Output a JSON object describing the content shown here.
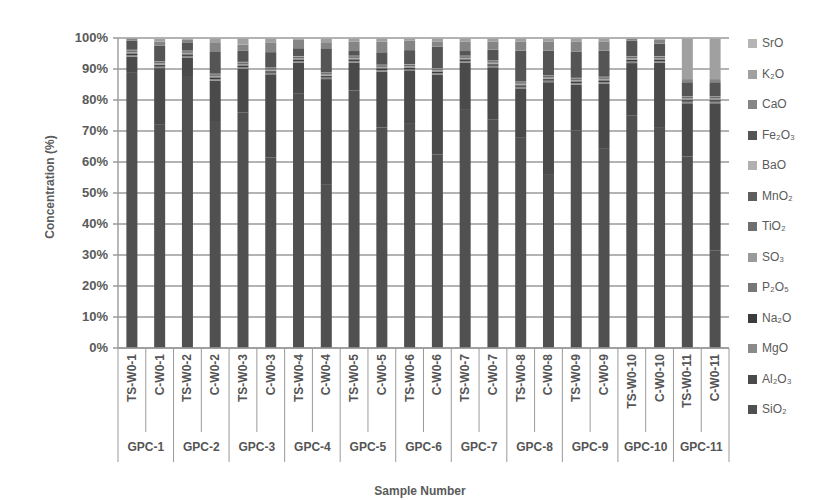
{
  "chart_data": {
    "type": "bar",
    "stacked": true,
    "percent": true,
    "title": "",
    "xlabel": "Sample Number",
    "ylabel": "Concentration (%)",
    "ylim": [
      0,
      100
    ],
    "yticks": [
      "0%",
      "10%",
      "20%",
      "30%",
      "40%",
      "50%",
      "60%",
      "70%",
      "80%",
      "90%",
      "100%"
    ],
    "grid": true,
    "legend_position": "right",
    "categories": [
      "TS-W0-1",
      "C-W0-1",
      "TS-W0-2",
      "C-W0-2",
      "TS-W0-3",
      "C-W0-3",
      "TS-W0-4",
      "C-W0-4",
      "TS-W0-5",
      "C-W0-5",
      "TS-W0-6",
      "C-W0-6",
      "TS-W0-7",
      "C-W0-7",
      "TS-W0-8",
      "C-W0-8",
      "TS-W0-9",
      "C-W0-9",
      "TS-W0-10",
      "C-W0-10",
      "TS-W0-11",
      "C-W0-11"
    ],
    "groups": [
      "GPC-1",
      "GPC-2",
      "GPC-3",
      "GPC-4",
      "GPC-5",
      "GPC-6",
      "GPC-7",
      "GPC-8",
      "GPC-9",
      "GPC-10",
      "GPC-11"
    ],
    "series": [
      {
        "name": "SiO2",
        "color": "#505050",
        "values": [
          89,
          72,
          88,
          73,
          75,
          62,
          82,
          54,
          83,
          71,
          72,
          63,
          77,
          74,
          68,
          56,
          71,
          65,
          75,
          71,
          61,
          31
        ]
      },
      {
        "name": "Al2O3",
        "color": "#4a4a4a",
        "values": [
          5,
          18,
          6,
          13,
          14,
          27,
          10,
          35,
          9,
          18,
          17,
          26,
          15,
          17,
          16,
          30,
          15,
          21,
          17,
          21,
          17,
          47
        ]
      },
      {
        "name": "MgO",
        "color": "#8a8a8a",
        "values": [
          0.5,
          0.5,
          0.5,
          0.5,
          0.5,
          0.5,
          0.5,
          0.5,
          0.5,
          0.5,
          0.5,
          0.5,
          0.5,
          0.5,
          0.5,
          0.5,
          0.5,
          0.5,
          0.5,
          0.5,
          0.5,
          0.5
        ]
      },
      {
        "name": "Na2O",
        "color": "#3c3c3c",
        "values": [
          0.5,
          0.5,
          0.5,
          0.5,
          0.5,
          0.5,
          0.5,
          0.5,
          0.5,
          0.5,
          0.5,
          0.5,
          0.5,
          0.5,
          0.5,
          0.5,
          0.5,
          0.5,
          0.5,
          0.5,
          0.5,
          0.5
        ]
      },
      {
        "name": "P2O5",
        "color": "#777777",
        "values": [
          0.2,
          0.2,
          0.2,
          0.2,
          0.2,
          0.2,
          0.2,
          0.2,
          0.2,
          0.2,
          0.2,
          0.2,
          0.2,
          0.2,
          0.2,
          0.2,
          0.2,
          0.2,
          0.2,
          0.2,
          0.2,
          0.2
        ]
      },
      {
        "name": "SO3",
        "color": "#9a9a9a",
        "values": [
          0.3,
          0.3,
          0.3,
          0.3,
          0.3,
          0.3,
          0.3,
          0.3,
          0.3,
          0.3,
          0.3,
          0.3,
          0.3,
          0.3,
          0.3,
          0.3,
          0.3,
          0.3,
          0.3,
          0.3,
          0.3,
          0.3
        ]
      },
      {
        "name": "TiO2",
        "color": "#6e6e6e",
        "values": [
          0.5,
          0.5,
          0.5,
          0.5,
          0.5,
          0.5,
          0.5,
          0.5,
          0.5,
          0.5,
          0.5,
          0.5,
          0.5,
          0.5,
          0.5,
          0.5,
          0.5,
          0.5,
          0.5,
          0.5,
          0.5,
          0.5
        ]
      },
      {
        "name": "MnO2",
        "color": "#5e5e5e",
        "values": [
          0.1,
          0.1,
          0.1,
          0.1,
          0.1,
          0.1,
          0.1,
          0.1,
          0.1,
          0.1,
          0.1,
          0.1,
          0.1,
          0.1,
          0.1,
          0.1,
          0.1,
          0.1,
          0.1,
          0.1,
          0.1,
          0.1
        ]
      },
      {
        "name": "BaO",
        "color": "#b0b0b0",
        "values": [
          0.1,
          0.1,
          0.1,
          0.1,
          0.1,
          0.1,
          0.1,
          0.1,
          0.1,
          0.1,
          0.1,
          0.1,
          0.1,
          0.1,
          0.1,
          0.1,
          0.1,
          0.1,
          0.1,
          0.1,
          0.1,
          0.1
        ]
      },
      {
        "name": "Fe2O3",
        "color": "#555555",
        "values": [
          3,
          5,
          2.5,
          7,
          3.5,
          5,
          2.5,
          8,
          1.5,
          4,
          4.5,
          7,
          1.5,
          3.5,
          10,
          8,
          8.5,
          8.5,
          5,
          4,
          4.5,
          4.5
        ]
      },
      {
        "name": "CaO",
        "color": "#858585",
        "values": [
          0.6,
          1.3,
          1,
          2.9,
          2,
          3,
          2.7,
          2,
          3.1,
          3.5,
          3,
          1.7,
          3.1,
          2.7,
          3,
          3,
          3.4,
          3,
          0.6,
          1.2,
          1,
          1
        ]
      },
      {
        "name": "K2O",
        "color": "#a0a0a0",
        "values": [
          0.1,
          1,
          0.5,
          1.5,
          2,
          1.5,
          0.5,
          1.3,
          1,
          1,
          0.8,
          1,
          1,
          1,
          1,
          1,
          1,
          1,
          0.2,
          0.5,
          13,
          13
        ]
      },
      {
        "name": "SrO",
        "color": "#b5b5b5",
        "values": [
          0.1,
          0.2,
          0.1,
          0.1,
          0.1,
          0.1,
          0.1,
          0.1,
          0.1,
          0.1,
          0.1,
          0.1,
          0.1,
          0.1,
          0.1,
          0.1,
          0.1,
          0.1,
          0.1,
          0.1,
          0.1,
          0.1
        ]
      }
    ]
  },
  "legend": {
    "items": [
      {
        "label": "SrO",
        "color": "#b5b5b5"
      },
      {
        "label": "K₂O",
        "color": "#a0a0a0"
      },
      {
        "label": "CaO",
        "color": "#858585"
      },
      {
        "label": "Fe₂O₃",
        "color": "#555555"
      },
      {
        "label": "BaO",
        "color": "#b0b0b0"
      },
      {
        "label": "MnO₂",
        "color": "#5e5e5e"
      },
      {
        "label": "TiO₂",
        "color": "#6e6e6e"
      },
      {
        "label": "SO₃",
        "color": "#9a9a9a"
      },
      {
        "label": "P₂O₅",
        "color": "#777777"
      },
      {
        "label": "Na₂O",
        "color": "#3c3c3c"
      },
      {
        "label": "MgO",
        "color": "#8a8a8a"
      },
      {
        "label": "Al₂O₃",
        "color": "#4a4a4a"
      },
      {
        "label": "SiO₂",
        "color": "#505050"
      }
    ]
  }
}
